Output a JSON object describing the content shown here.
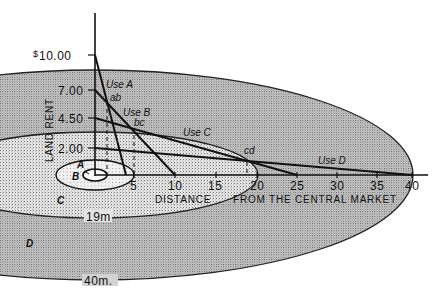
{
  "figure": {
    "y_axis": {
      "currency_symbol": "$",
      "title": "LAND RENT",
      "ticks": [
        "10.00",
        "7.00",
        "4.50",
        "2.00"
      ]
    },
    "x_axis": {
      "title_part1": "DISTANCE",
      "title_part2": "FROM THE CENTRAL MARKET",
      "ticks": [
        "5",
        "10",
        "15",
        "20",
        "25",
        "30",
        "35",
        "40"
      ]
    },
    "curves": [
      {
        "label": "Use A",
        "rent_at_center": 10.0,
        "zero_at_distance": 4
      },
      {
        "label": "Use B",
        "rent_at_center": 7.0,
        "zero_at_distance": 10
      },
      {
        "label": "Use C",
        "rent_at_center": 4.5,
        "zero_at_distance": 25
      },
      {
        "label": "Use D",
        "rent_at_center": 2.0,
        "zero_at_distance": 40
      }
    ],
    "intersections": [
      "ab",
      "bc",
      "cd"
    ],
    "zones": {
      "a": "A",
      "b": "B",
      "c": "C",
      "d": "D"
    },
    "ring_labels": {
      "inner": "19m",
      "outer": "40m."
    }
  }
}
